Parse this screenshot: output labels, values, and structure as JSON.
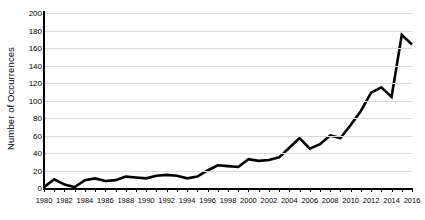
{
  "chart_data": {
    "type": "line",
    "title": "",
    "xlabel": "",
    "ylabel": "Number of Occurrences",
    "ylim": [
      0,
      200
    ],
    "ytick_step": 20,
    "yticks": [
      0,
      20,
      40,
      60,
      80,
      100,
      120,
      140,
      160,
      180,
      200
    ],
    "xlim": [
      1980,
      2016
    ],
    "xtick_step": 1,
    "xtick_label_step": 2,
    "xtick_labels": [
      "1980",
      "1982",
      "1984",
      "1986",
      "1988",
      "1990",
      "1992",
      "1994",
      "1996",
      "1998",
      "2000",
      "2002",
      "2004",
      "2006",
      "2008",
      "2010",
      "2012",
      "2014",
      "2016"
    ],
    "grid": "horizontal",
    "legend": "none",
    "series": [
      {
        "name": "Occurrences",
        "color": "#000000",
        "x": [
          1980,
          1981,
          1982,
          1983,
          1984,
          1985,
          1986,
          1987,
          1988,
          1989,
          1990,
          1991,
          1992,
          1993,
          1994,
          1995,
          1996,
          1997,
          1998,
          1999,
          2000,
          2001,
          2002,
          2003,
          2004,
          2005,
          2006,
          2007,
          2008,
          2009,
          2010,
          2011,
          2012,
          2013,
          2014,
          2015,
          2016
        ],
        "values": [
          1,
          10,
          4,
          1,
          9,
          11,
          8,
          9,
          13,
          12,
          11,
          14,
          15,
          14,
          11,
          13,
          20,
          26,
          25,
          24,
          33,
          31,
          32,
          35,
          46,
          57,
          45,
          50,
          60,
          57,
          72,
          88,
          109,
          115,
          104,
          175,
          164
        ]
      }
    ],
    "colors": {
      "line": "#000000",
      "grid": "#dcdcdc",
      "axis": "#000000",
      "background": "#ffffff",
      "text": "#000000"
    }
  }
}
